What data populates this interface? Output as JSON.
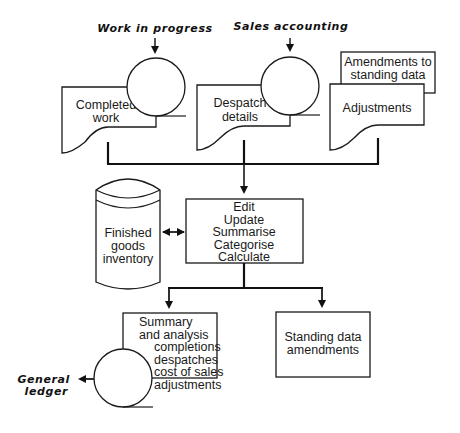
{
  "diagram": {
    "type": "system flowchart",
    "inputs": {
      "work_in_progress": {
        "label": "Work in progress"
      },
      "sales_accounting": {
        "label": "Sales accounting"
      }
    },
    "documents": {
      "completed_work": {
        "line1": "Completed",
        "line2": "work"
      },
      "despatch_details": {
        "line1": "Despatch",
        "line2": "details"
      },
      "amendments_card": {
        "line1": "Amendments to",
        "line2": "standing data"
      },
      "adjustments": {
        "line1": "Adjustments"
      }
    },
    "storage": {
      "finished_goods": {
        "line1": "Finished",
        "line2": "goods",
        "line3": "inventory"
      }
    },
    "process": {
      "steps": [
        "Edit",
        "Update",
        "Summarise",
        "Categorise",
        "Calculate"
      ]
    },
    "outputs": {
      "summary": {
        "line1": "Summary",
        "line2": "and  analysis",
        "items": [
          "completions",
          "despatches",
          "cost of sales",
          "adjustments"
        ]
      },
      "standing_data": {
        "line1": "Standing data",
        "line2": "amendments"
      },
      "general_ledger": {
        "line1": "General",
        "line2": "ledger"
      }
    },
    "colors": {
      "line": "#1a1a1a",
      "background": "#ffffff"
    }
  }
}
